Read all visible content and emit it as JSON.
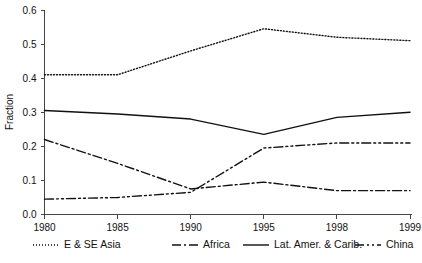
{
  "chart_data": {
    "type": "line",
    "title": "",
    "xlabel": "",
    "ylabel": "Fraction",
    "categories": [
      "1980",
      "1985",
      "1990",
      "1995",
      "1998",
      "1999"
    ],
    "x_tick_labels": [
      "1980",
      "1985",
      "1990",
      "1995",
      "1998",
      "1999"
    ],
    "y_tick_labels": [
      "0.0",
      "0.1",
      "0.2",
      "0.3",
      "0.4",
      "0.5",
      "0.6"
    ],
    "y_ticks": [
      0.0,
      0.1,
      0.2,
      0.3,
      0.4,
      0.5,
      0.6
    ],
    "ylim": [
      0.0,
      0.6
    ],
    "grid": false,
    "legend_position": "bottom",
    "series": [
      {
        "name": "E & SE Asia",
        "style": "dotted",
        "dash": "1,2",
        "values": [
          0.41,
          0.41,
          0.48,
          0.545,
          0.52,
          0.51
        ]
      },
      {
        "name": "Africa",
        "style": "dash-dot",
        "dash": "9,3,2,3",
        "values": [
          0.22,
          0.15,
          0.075,
          0.095,
          0.07,
          0.07
        ]
      },
      {
        "name": "Lat. Amer. & Carib.",
        "style": "solid",
        "dash": "none",
        "values": [
          0.305,
          0.295,
          0.28,
          0.235,
          0.285,
          0.3
        ]
      },
      {
        "name": "China",
        "style": "dash-dot-dot",
        "dash": "9,3,2,3,2,3",
        "values": [
          0.045,
          0.05,
          0.065,
          0.195,
          0.21,
          0.21
        ]
      }
    ]
  },
  "legend": {
    "items": [
      {
        "label": "E & SE Asia"
      },
      {
        "label": "Africa"
      },
      {
        "label": "Lat. Amer. & Carib."
      },
      {
        "label": "China"
      }
    ]
  },
  "axes": {
    "y_title": "Fraction"
  }
}
